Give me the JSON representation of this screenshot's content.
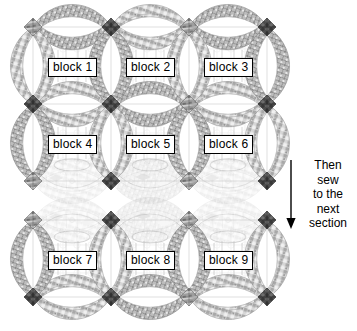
{
  "diagram": {
    "colors": {
      "ink": "#000000",
      "paper": "#ffffff",
      "arc_light": "#c9c9c9",
      "arc_mid": "#9a9a9a",
      "arc_dark": "#4a4a4a",
      "arc_darkest": "#2b2b2b",
      "outline": "#b0b0b0",
      "label_border": "#000000",
      "label_bg": "#ffffff"
    },
    "sections": [
      {
        "name": "upper-section",
        "rows": [
          {
            "name": "row-1",
            "blocks": [
              {
                "label": "block 1"
              },
              {
                "label": "block 2"
              },
              {
                "label": "block 3"
              }
            ]
          },
          {
            "name": "row-2",
            "blocks": [
              {
                "label": "block 4"
              },
              {
                "label": "block 5"
              },
              {
                "label": "block 6"
              }
            ]
          }
        ]
      },
      {
        "name": "lower-section",
        "rows": [
          {
            "name": "row-3",
            "blocks": [
              {
                "label": "block 7"
              },
              {
                "label": "block 8"
              },
              {
                "label": "block 9"
              }
            ]
          }
        ]
      }
    ],
    "blocks": [
      {
        "id": 1,
        "label": "block 1",
        "cx": 72,
        "cy": 66,
        "label_x": 48,
        "label_y": 58
      },
      {
        "id": 2,
        "label": "block 2",
        "cx": 150,
        "cy": 66,
        "label_x": 126,
        "label_y": 58
      },
      {
        "id": 3,
        "label": "block 3",
        "cx": 228,
        "cy": 66,
        "label_x": 204,
        "label_y": 58
      },
      {
        "id": 4,
        "label": "block 4",
        "cx": 72,
        "cy": 143,
        "label_x": 48,
        "label_y": 135
      },
      {
        "id": 5,
        "label": "block 5",
        "cx": 150,
        "cy": 143,
        "label_x": 126,
        "label_y": 135
      },
      {
        "id": 6,
        "label": "block 6",
        "cx": 228,
        "cy": 143,
        "label_x": 204,
        "label_y": 135
      },
      {
        "id": 7,
        "label": "block 7",
        "cx": 72,
        "cy": 259,
        "label_x": 48,
        "label_y": 251
      },
      {
        "id": 8,
        "label": "block 8",
        "cx": 150,
        "cy": 259,
        "label_x": 126,
        "label_y": 251
      },
      {
        "id": 9,
        "label": "block 9",
        "cx": 228,
        "cy": 259,
        "label_x": 204,
        "label_y": 251
      }
    ],
    "annotation": {
      "name": "sew-instruction",
      "lines": [
        "Then",
        "sew",
        "to the",
        "next",
        "section"
      ],
      "arrow": {
        "direction": "down",
        "x": 291,
        "y_start": 160,
        "y_end": 228
      }
    }
  }
}
